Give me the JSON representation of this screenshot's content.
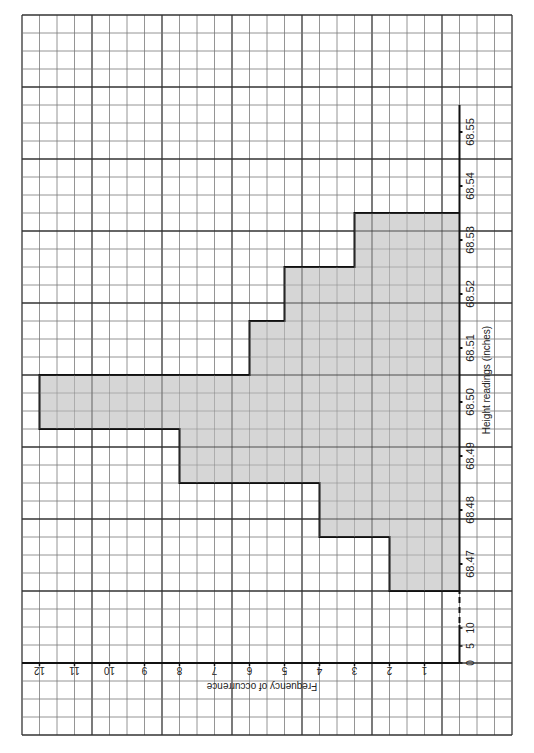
{
  "chart_data": {
    "type": "bar",
    "orientation": "horizontal (page rotated 90°; bars extend leftward from baseline)",
    "title": "",
    "categories": [
      "68.47",
      "68.48",
      "68.49",
      "68.50",
      "68.51",
      "68.52",
      "68.53",
      "68.54",
      "68.55"
    ],
    "values": [
      2,
      4,
      8,
      12,
      6,
      5,
      3,
      0,
      0
    ],
    "xlabel": "Height readings (inches)",
    "ylabel": "Frequency of occurrence",
    "ylim": [
      0,
      12
    ],
    "y_ticks": [
      "1",
      "2",
      "3",
      "4",
      "5",
      "6",
      "7",
      "8",
      "9",
      "10",
      "11",
      "12"
    ],
    "x_break_ticks": [
      "0",
      "5",
      "10"
    ],
    "grid": true,
    "legend": null,
    "bar_color": "#d6d6d6",
    "grid_color_minor": "#7a7a7a",
    "grid_color_major": "#333333"
  },
  "axes": {
    "freq_label": "Frequency of occurrence",
    "height_label": "Height readings (inches)",
    "freq_ticks": [
      "1",
      "2",
      "3",
      "4",
      "5",
      "6",
      "7",
      "8",
      "9",
      "10",
      "11",
      "12"
    ],
    "height_ticks": [
      "68.47",
      "68.48",
      "68.49",
      "68.50",
      "68.51",
      "68.52",
      "68.53",
      "68.54",
      "68.55"
    ],
    "break_ticks": [
      "0",
      "5",
      "10"
    ]
  }
}
